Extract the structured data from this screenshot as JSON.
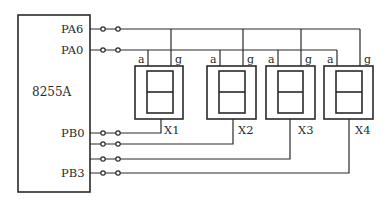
{
  "diagram": {
    "title": "",
    "chip": {
      "label": "8255A",
      "ports": [
        {
          "name": "PA6",
          "y": 29
        },
        {
          "name": "PA0",
          "y": 50
        },
        {
          "name": "PB0",
          "y": 133
        },
        {
          "name": "",
          "y": 144
        },
        {
          "name": "",
          "y": 159
        },
        {
          "name": "PB3",
          "y": 173
        }
      ]
    },
    "displays": [
      {
        "label": "X1",
        "segment_pins": [
          "a",
          "g"
        ]
      },
      {
        "label": "X2",
        "segment_pins": [
          "a",
          "g"
        ]
      },
      {
        "label": "X3",
        "segment_pins": [
          "a",
          "g"
        ]
      },
      {
        "label": "X4",
        "segment_pins": [
          "a",
          "g"
        ]
      }
    ],
    "connections": [
      {
        "from": "PA6",
        "to": "g (X1, X2, X3, X4)"
      },
      {
        "from": "PA0",
        "to": "a (X1, X2, X3, X4)"
      },
      {
        "from": "PB0",
        "to": "X1 common"
      },
      {
        "from": "PB1",
        "to": "X2 common"
      },
      {
        "from": "PB2",
        "to": "X3 common"
      },
      {
        "from": "PB3",
        "to": "X4 common"
      }
    ],
    "colors": {
      "line": "#2a2a2a",
      "background": "#ffffff"
    }
  }
}
